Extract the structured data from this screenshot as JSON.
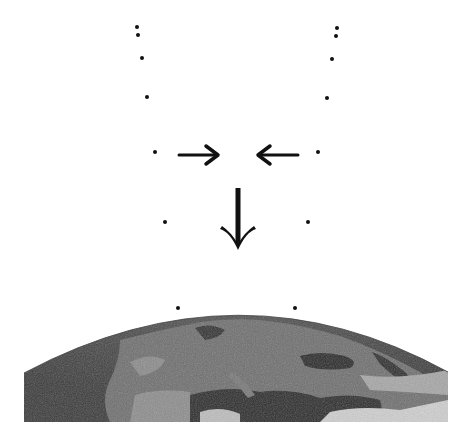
{
  "diagram": {
    "colors": {
      "background": "#ffffff",
      "ink": "#111111",
      "earth_dark": "#2e2e2e",
      "earth_mid": "#6a6a6a",
      "earth_light": "#a8a8a8",
      "earth_cloud": "#d0d0d0"
    },
    "left_dots": [
      {
        "x": 137,
        "y": 27
      },
      {
        "x": 138,
        "y": 35
      },
      {
        "x": 142,
        "y": 58
      },
      {
        "x": 147,
        "y": 97
      },
      {
        "x": 155,
        "y": 152
      },
      {
        "x": 165,
        "y": 222
      },
      {
        "x": 178,
        "y": 308
      }
    ],
    "right_dots": [
      {
        "x": 337,
        "y": 28
      },
      {
        "x": 336,
        "y": 36
      },
      {
        "x": 332,
        "y": 59
      },
      {
        "x": 327,
        "y": 98
      },
      {
        "x": 318,
        "y": 152
      },
      {
        "x": 308,
        "y": 222
      },
      {
        "x": 295,
        "y": 308
      }
    ],
    "arrows": [
      {
        "name": "right-arrow",
        "direction": "right",
        "from": [
          179,
          155
        ],
        "to": [
          218,
          155
        ]
      },
      {
        "name": "left-arrow",
        "direction": "left",
        "from": [
          298,
          155
        ],
        "to": [
          258,
          155
        ]
      },
      {
        "name": "down-arrow",
        "direction": "down",
        "from": [
          238,
          188
        ],
        "to": [
          238,
          250
        ]
      }
    ],
    "earth": {
      "label": "Earth (Europe view from orbit)",
      "left": 24,
      "right": 448,
      "bottom": 422,
      "apex_y": 316,
      "side_top_y": 373
    }
  }
}
